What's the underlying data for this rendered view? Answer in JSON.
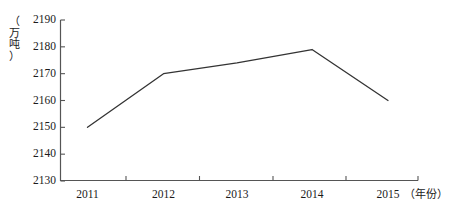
{
  "chart_data": {
    "type": "line",
    "title": "",
    "subtitle": "",
    "xlabel": "（年份）",
    "ylabel": "（万吨）",
    "categories": [
      "2011",
      "2012",
      "2013",
      "2014",
      "2015"
    ],
    "values": [
      2150,
      2170,
      2174,
      2179,
      2160
    ],
    "series": [
      {
        "name": "产量",
        "values": [
          2150,
          2170,
          2174,
          2179,
          2160
        ]
      }
    ],
    "ylim": [
      2130,
      2190
    ],
    "ytick_labels": [
      "2190",
      "2180",
      "2170",
      "2160",
      "2150",
      "2140",
      "2130"
    ],
    "ytick_values": [
      2190,
      2180,
      2170,
      2160,
      2150,
      2140,
      2130
    ],
    "xtick_labels": [
      "2011",
      "2012",
      "2013",
      "2014",
      "2015"
    ],
    "grid": false,
    "legend": false,
    "legend_position": "none",
    "line_color": "#333333",
    "axis_color": "#555555",
    "markers": false
  },
  "axis": {
    "y_unit_chars": [
      "（",
      "万",
      "吨",
      "）"
    ],
    "x_unit_label": "（年份）"
  }
}
